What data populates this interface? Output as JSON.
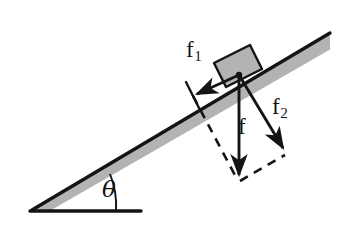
{
  "figure": {
    "type": "physics-free-body-diagram",
    "background_color": "#ffffff",
    "ink_color": "#141414",
    "incline_fill_color": "#b3b3b3"
  },
  "labels": {
    "f1": {
      "base": "f",
      "sub": "1"
    },
    "f2": {
      "base": "f",
      "sub": "2"
    },
    "f": "f",
    "theta": "θ"
  },
  "geometry": {
    "incline": {
      "apex": [
        32,
        210
      ],
      "top_edge_start": [
        32,
        210
      ],
      "top_edge_end": [
        330,
        33
      ],
      "band_thickness_px": 16
    },
    "baseline": {
      "start": [
        32,
        211
      ],
      "end": [
        141,
        211
      ]
    },
    "angle_arc": {
      "center": [
        32,
        210
      ],
      "radius": 84,
      "label_position": [
        110,
        190
      ]
    },
    "block": {
      "corners": [
        [
          214,
          63
        ],
        [
          250,
          45
        ],
        [
          262,
          69
        ],
        [
          226,
          87
        ]
      ],
      "fill": "#b3b3b3"
    },
    "origin_point": [
      239,
      75
    ],
    "vectors": [
      {
        "name": "f1",
        "from": [
          239,
          75
        ],
        "to": [
          193,
          96
        ],
        "style": "solid",
        "arrowhead": true
      },
      {
        "name": "f",
        "from": [
          239,
          75
        ],
        "to": [
          239,
          180
        ],
        "style": "solid",
        "arrowhead": true
      },
      {
        "name": "f2",
        "from": [
          239,
          75
        ],
        "to": [
          286,
          153
        ],
        "style": "solid",
        "arrowhead": true
      }
    ],
    "construction_lines": [
      {
        "from": [
          193,
          96
        ],
        "to": [
          239,
          180
        ],
        "style": "dashed"
      },
      {
        "from": [
          239,
          180
        ],
        "to": [
          286,
          153
        ],
        "style": "dashed"
      },
      {
        "name": "perpendicular-tick",
        "from": [
          186,
          83
        ],
        "to": [
          199,
          109
        ],
        "style": "solid"
      }
    ]
  }
}
